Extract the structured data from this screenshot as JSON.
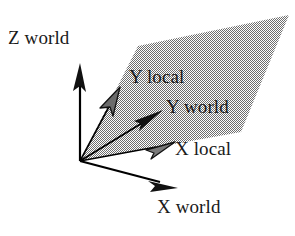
{
  "figure": {
    "background_color": "#ffffff",
    "line_color": "#000000",
    "text_color": "#1a1a1a",
    "plane_fill_color": "#a8a8a8",
    "plane_pattern": "dither-halftone",
    "origin": {
      "x": 80,
      "y": 161
    }
  },
  "labels": {
    "z_world": "Z world",
    "y_local": "Y local",
    "y_world": "Y world",
    "x_local": "X local",
    "x_world": "X world"
  },
  "axes": [
    {
      "name": "z-world-axis",
      "label": "Z world",
      "kind": "world",
      "arrowhead": "solid-black",
      "from": {
        "x": 80,
        "y": 161
      },
      "to": {
        "x": 80,
        "y": 66
      }
    },
    {
      "name": "y-local-axis",
      "label": "Y local",
      "kind": "local",
      "arrowhead": "gray-open",
      "from": {
        "x": 80,
        "y": 161
      },
      "to": {
        "x": 118,
        "y": 90
      }
    },
    {
      "name": "y-world-axis",
      "label": "Y world",
      "kind": "world",
      "arrowhead": "solid-black",
      "from": {
        "x": 80,
        "y": 161
      },
      "to": {
        "x": 161,
        "y": 111
      }
    },
    {
      "name": "x-local-axis",
      "label": "X local",
      "kind": "local",
      "arrowhead": "gray-open",
      "from": {
        "x": 80,
        "y": 161
      },
      "to": {
        "x": 173,
        "y": 143
      }
    },
    {
      "name": "x-world-axis",
      "label": "X world",
      "kind": "world",
      "arrowhead": "solid-black",
      "from": {
        "x": 80,
        "y": 161
      },
      "to": {
        "x": 176,
        "y": 187
      }
    }
  ],
  "plane": {
    "name": "local-xy-plane",
    "points": "138,46 289,15 241,132 80,161",
    "fill": "#a8a8a8"
  }
}
